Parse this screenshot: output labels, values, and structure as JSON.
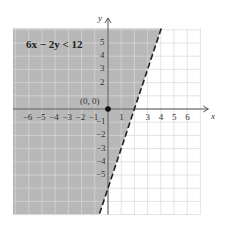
{
  "chart_data": {
    "type": "inequality-region",
    "title": "6x − 2y < 12",
    "boundary_line": {
      "equation": "y = 3x − 6",
      "style": "dashed",
      "x_intercept": 2,
      "y_intercept": -6
    },
    "shaded_side": "left/above (contains origin)",
    "test_point": {
      "label": "(0, 0)",
      "x": 0,
      "y": 0
    },
    "xlabel": "x",
    "ylabel": "y",
    "x_ticks": [
      -6,
      -5,
      -4,
      -3,
      -2,
      -1,
      1,
      3,
      4,
      5,
      6
    ],
    "y_ticks": [
      5,
      4,
      3,
      2,
      -1,
      -2,
      -3,
      -4,
      -5
    ],
    "xlim": [
      -6,
      7
    ],
    "ylim": [
      -7,
      6
    ],
    "grid": true,
    "shade_color": "#b8b8b8"
  },
  "labels": {
    "title": "6x − 2y < 12",
    "origin": "(0, 0)",
    "x_axis": "x",
    "y_axis": "y"
  }
}
